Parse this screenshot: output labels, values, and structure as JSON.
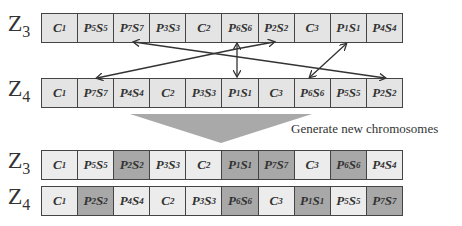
{
  "labels": {
    "z3": {
      "letter": "Z",
      "sub": "3"
    },
    "z4": {
      "letter": "Z",
      "sub": "4"
    }
  },
  "caption": "Generate new chromosomes",
  "colors": {
    "cell_light": "#e4e4e4",
    "cell_dark": "#a8a8a8",
    "border": "#444444",
    "arrow": "#333333",
    "triangle": "#a9a9a9"
  },
  "before": {
    "z3": [
      {
        "b": "C",
        "s": "1"
      },
      {
        "b": "P5S5"
      },
      {
        "b": "P7S7"
      },
      {
        "b": "P3S3"
      },
      {
        "b": "C",
        "s": "2"
      },
      {
        "b": "P6S6"
      },
      {
        "b": "P2S2"
      },
      {
        "b": "C",
        "s": "3"
      },
      {
        "b": "P1S1"
      },
      {
        "b": "P4S4"
      }
    ],
    "z4": [
      {
        "b": "C",
        "s": "1"
      },
      {
        "b": "P7S7"
      },
      {
        "b": "P4S4"
      },
      {
        "b": "C",
        "s": "2"
      },
      {
        "b": "P3S3"
      },
      {
        "b": "P1S1"
      },
      {
        "b": "C",
        "s": "3"
      },
      {
        "b": "P6S6"
      },
      {
        "b": "P5S5"
      },
      {
        "b": "P2S2"
      }
    ]
  },
  "after": {
    "z3": [
      {
        "b": "C",
        "s": "1",
        "shade": "light"
      },
      {
        "b": "P5S5",
        "shade": "light"
      },
      {
        "b": "P2S2",
        "shade": "dark"
      },
      {
        "b": "P3S3",
        "shade": "light"
      },
      {
        "b": "C",
        "s": "2",
        "shade": "light"
      },
      {
        "b": "P1S1",
        "shade": "dark"
      },
      {
        "b": "P7S7",
        "shade": "dark"
      },
      {
        "b": "C",
        "s": "3",
        "shade": "light"
      },
      {
        "b": "P6S6",
        "shade": "dark"
      },
      {
        "b": "P4S4",
        "shade": "light"
      }
    ],
    "z4": [
      {
        "b": "C",
        "s": "1",
        "shade": "light"
      },
      {
        "b": "P2S2",
        "shade": "dark"
      },
      {
        "b": "P4S4",
        "shade": "light"
      },
      {
        "b": "C",
        "s": "2",
        "shade": "light"
      },
      {
        "b": "P3S3",
        "shade": "light"
      },
      {
        "b": "P6S6",
        "shade": "dark"
      },
      {
        "b": "C",
        "s": "3",
        "shade": "light"
      },
      {
        "b": "P1S1",
        "shade": "dark"
      },
      {
        "b": "P5S5",
        "shade": "light"
      },
      {
        "b": "P7S7",
        "shade": "dark"
      }
    ]
  },
  "arrows": [
    {
      "from": "Z3.P6S6",
      "to": "Z4.P7S7"
    },
    {
      "from": "Z3.P6S6",
      "to": "Z4.P1S1",
      "bidirectional": true
    },
    {
      "from": "Z3.P6S6",
      "to": "Z3.P2S2"
    },
    {
      "from": "Z4.P2S2",
      "to": "Z3.P7S7"
    },
    {
      "from": "Z3.P1S1",
      "to": "Z4.P6S6",
      "bidirectional": true
    }
  ]
}
